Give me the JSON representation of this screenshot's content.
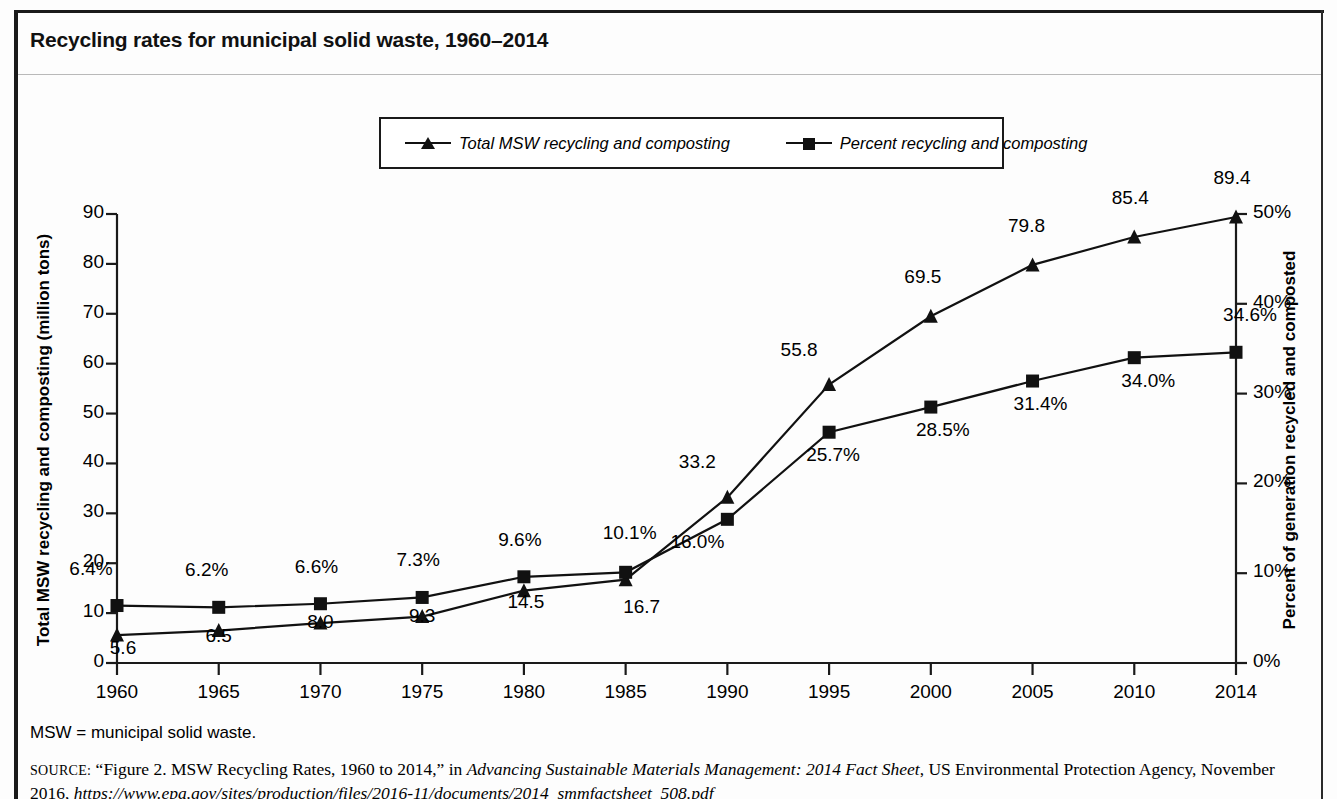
{
  "figure": {
    "title": "Recycling rates for municipal solid waste, 1960–2014",
    "footnote": "MSW = municipal solid waste.",
    "source": {
      "prefix": "SOURCE:",
      "quoted": "“Figure 2. MSW Recycling Rates, 1960 to 2014,”",
      "in_word": "in",
      "publication": "Advancing Sustainable Materials Management: 2014 Fact Sheet",
      "publisher": ", US Environmental Protection Agency, November 2016,",
      "url": "https://www.epa.gov/sites/production/files/2016-11/documents/2014_smmfactsheet_508.pdf"
    }
  },
  "legend": {
    "items": [
      {
        "label": "Total MSW recycling and composting",
        "marker": "triangle-marker"
      },
      {
        "label": "Percent recycling and composting",
        "marker": "square-marker"
      }
    ]
  },
  "chart_data": {
    "type": "line",
    "title": "Recycling rates for municipal solid waste, 1960–2014",
    "xlabel": "",
    "categories": [
      "1960",
      "1965",
      "1970",
      "1975",
      "1980",
      "1985",
      "1990",
      "1995",
      "2000",
      "2005",
      "2010",
      "2014"
    ],
    "x": [
      1960,
      1965,
      1970,
      1975,
      1980,
      1985,
      1990,
      1995,
      2000,
      2005,
      2010,
      2014
    ],
    "grid": false,
    "legend_position": "top-center",
    "series": [
      {
        "name": "Total MSW recycling and composting",
        "axis": "left",
        "marker": "triangle",
        "unit": "million tons",
        "values": [
          5.6,
          6.5,
          8.0,
          9.3,
          14.5,
          16.7,
          33.2,
          55.8,
          69.5,
          79.8,
          85.4,
          89.4
        ],
        "labels": [
          "5.6",
          "6.5",
          "8.0",
          "9.3",
          "14.5",
          "16.7",
          "33.2",
          "55.8",
          "69.5",
          "79.8",
          "85.4",
          "89.4"
        ]
      },
      {
        "name": "Percent recycling and composting",
        "axis": "right",
        "marker": "square",
        "unit": "percent",
        "values": [
          6.4,
          6.2,
          6.6,
          7.3,
          9.6,
          10.1,
          16.0,
          25.7,
          28.5,
          31.4,
          34.0,
          34.6
        ],
        "labels": [
          "6.4%",
          "6.2%",
          "6.6%",
          "7.3%",
          "9.6%",
          "10.1%",
          "16.0%",
          "25.7%",
          "28.5%",
          "31.4%",
          "34.0%",
          "34.6%"
        ]
      }
    ],
    "left_axis": {
      "label": "Total MSW recycling and composting (million tons)",
      "ylim": [
        0,
        90
      ],
      "ticks": [
        0,
        10,
        20,
        30,
        40,
        50,
        60,
        70,
        80,
        90
      ],
      "tick_labels": [
        "0",
        "10",
        "20",
        "30",
        "40",
        "50",
        "60",
        "70",
        "80",
        "90"
      ]
    },
    "right_axis": {
      "label": "Percent of generation recycled and composted",
      "ylim": [
        0,
        50
      ],
      "ticks": [
        0,
        10,
        20,
        30,
        40,
        50
      ],
      "tick_labels": [
        "0%",
        "10%",
        "20%",
        "30%",
        "40%",
        "50%"
      ]
    },
    "colors": {
      "line": "#111111",
      "marker": "#111111",
      "background": "#ffffff"
    }
  }
}
